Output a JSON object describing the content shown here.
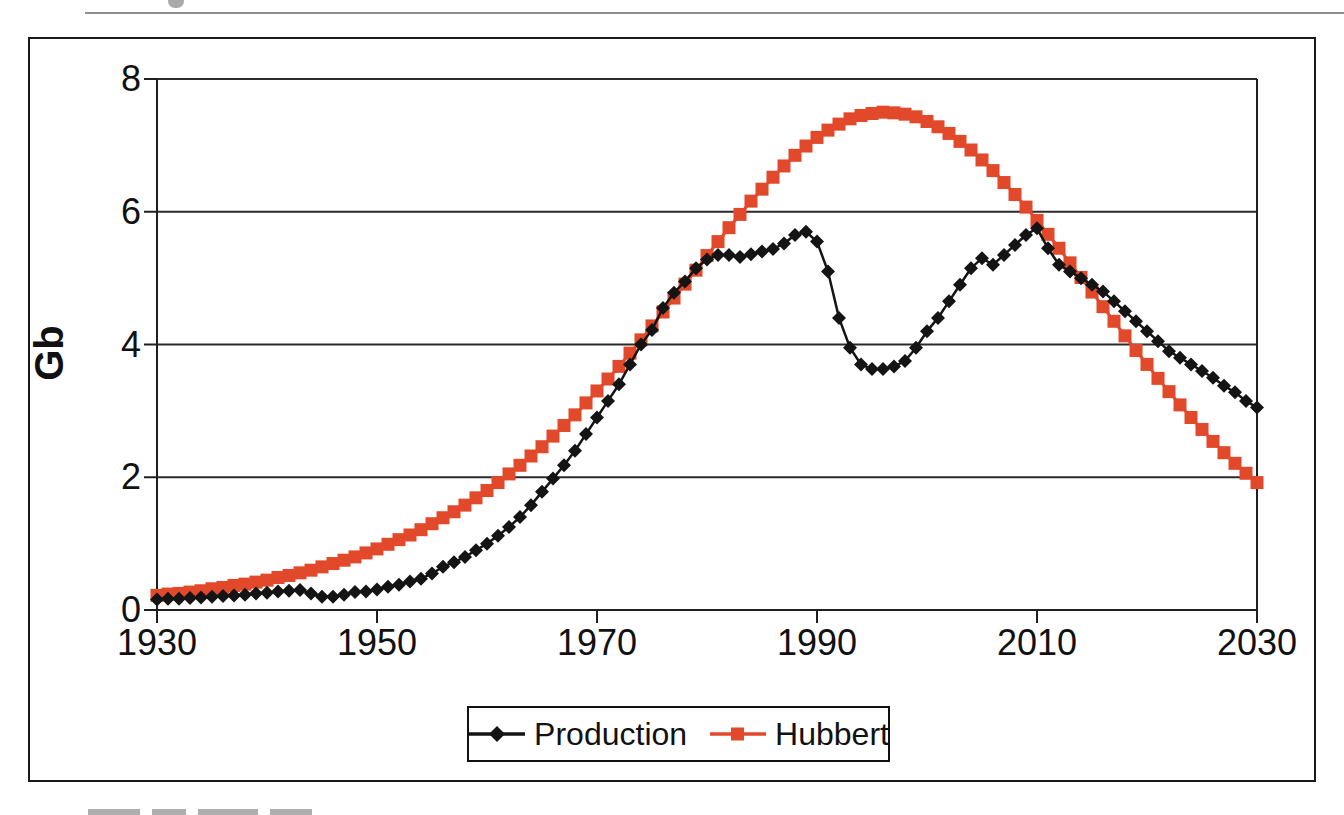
{
  "page": {
    "background": "#FFFFFF",
    "top_rule": true,
    "cropped_fragments": "partial glyphs cut off at top and bottom page edges"
  },
  "colors": {
    "production": "#141414",
    "hubbert": "#E2492B",
    "grid": "#2b2b2b",
    "axis": "#1f1f1f",
    "frame_border": "#1a1a1a",
    "rule": "#8f8f8f",
    "text": "#111111",
    "background": "#FFFFFF"
  },
  "chart_data": {
    "type": "line",
    "title": "",
    "xlabel": "",
    "ylabel": "Gb",
    "xlim": [
      1930,
      2030
    ],
    "ylim": [
      0,
      8
    ],
    "xticks": [
      1930,
      1950,
      1970,
      1990,
      2010,
      2030
    ],
    "yticks": [
      0,
      2,
      4,
      6,
      8
    ],
    "grid": "horizontal",
    "legend_position": "bottom-center",
    "x_step": 1,
    "series": [
      {
        "name": "Production",
        "marker": "diamond",
        "color": "#141414",
        "x_start": 1930,
        "values": [
          0.16,
          0.17,
          0.17,
          0.18,
          0.19,
          0.2,
          0.21,
          0.22,
          0.23,
          0.25,
          0.26,
          0.28,
          0.29,
          0.3,
          0.25,
          0.2,
          0.2,
          0.23,
          0.27,
          0.28,
          0.31,
          0.35,
          0.38,
          0.43,
          0.47,
          0.55,
          0.65,
          0.72,
          0.8,
          0.9,
          1.0,
          1.12,
          1.25,
          1.4,
          1.58,
          1.78,
          1.98,
          2.18,
          2.4,
          2.65,
          2.9,
          3.15,
          3.4,
          3.7,
          4.0,
          4.22,
          4.55,
          4.78,
          4.95,
          5.15,
          5.28,
          5.35,
          5.35,
          5.32,
          5.36,
          5.4,
          5.44,
          5.52,
          5.65,
          5.7,
          5.55,
          5.1,
          4.4,
          3.95,
          3.7,
          3.63,
          3.63,
          3.67,
          3.75,
          3.95,
          4.2,
          4.4,
          4.65,
          4.9,
          5.15,
          5.3,
          5.2,
          5.35,
          5.5,
          5.65,
          5.75,
          5.45,
          5.2,
          5.1,
          5.0,
          4.9,
          4.8,
          4.65,
          4.5,
          4.35,
          4.2,
          4.05,
          3.9,
          3.8,
          3.7,
          3.6,
          3.5,
          3.38,
          3.28,
          3.15,
          3.05
        ]
      },
      {
        "name": "Hubbert",
        "marker": "square",
        "color": "#E2492B",
        "x_start": 1930,
        "values": [
          0.22,
          0.24,
          0.25,
          0.27,
          0.29,
          0.32,
          0.34,
          0.37,
          0.39,
          0.42,
          0.45,
          0.49,
          0.52,
          0.56,
          0.6,
          0.65,
          0.7,
          0.75,
          0.8,
          0.86,
          0.92,
          0.99,
          1.06,
          1.13,
          1.21,
          1.3,
          1.39,
          1.48,
          1.58,
          1.69,
          1.8,
          1.92,
          2.05,
          2.18,
          2.32,
          2.46,
          2.62,
          2.78,
          2.94,
          3.12,
          3.3,
          3.48,
          3.67,
          3.87,
          4.07,
          4.28,
          4.49,
          4.7,
          4.91,
          5.12,
          5.34,
          5.55,
          5.76,
          5.96,
          6.16,
          6.34,
          6.52,
          6.69,
          6.85,
          6.99,
          7.12,
          7.23,
          7.32,
          7.4,
          7.45,
          7.48,
          7.5,
          7.49,
          7.47,
          7.43,
          7.36,
          7.28,
          7.18,
          7.06,
          6.93,
          6.78,
          6.62,
          6.44,
          6.26,
          6.07,
          5.87,
          5.66,
          5.45,
          5.23,
          5.01,
          4.79,
          4.57,
          4.35,
          4.13,
          3.91,
          3.7,
          3.49,
          3.29,
          3.09,
          2.9,
          2.72,
          2.54,
          2.37,
          2.21,
          2.06,
          1.92
        ]
      }
    ]
  },
  "legend": {
    "items": [
      {
        "label": "Production",
        "marker": "diamond"
      },
      {
        "label": "Hubbert",
        "marker": "square"
      }
    ]
  }
}
